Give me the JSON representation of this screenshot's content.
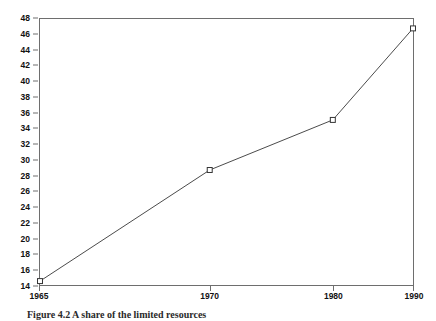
{
  "chart_data": {
    "type": "line",
    "title": "",
    "xlabel": "",
    "ylabel": "",
    "categories": [
      "1965",
      "1970",
      "1980",
      "1990"
    ],
    "x": [
      1965,
      1970,
      1980,
      1990
    ],
    "values": [
      14.5,
      28.7,
      35.1,
      46.8
    ],
    "series": [
      {
        "name": "",
        "values": [
          14.5,
          28.7,
          35.1,
          46.8
        ]
      }
    ],
    "ylim": [
      14,
      48
    ],
    "ytick_step": 2,
    "yticks": [
      14,
      16,
      18,
      20,
      22,
      24,
      26,
      28,
      30,
      32,
      34,
      36,
      38,
      40,
      42,
      44,
      46,
      48
    ],
    "ytick_labels": [
      "14",
      "16",
      "18",
      "20",
      "22",
      "24",
      "26",
      "28",
      "30",
      "32",
      "34",
      "36",
      "38",
      "40",
      "42",
      "44",
      "46",
      "48"
    ],
    "xticks": [
      1965,
      1970,
      1980,
      1990
    ],
    "xtick_labels": [
      "1965",
      "1970",
      "1980",
      "1990"
    ],
    "xtick_positions_pct": [
      0,
      45.5,
      78.5,
      100
    ],
    "grid": false,
    "legend": null,
    "marker": "open-square",
    "line_color": "#4a4a4a",
    "marker_color": "#333333",
    "frame_color": "#6e6e6e",
    "background": "#ffffff"
  },
  "caption": {
    "text": "Figure 4.2  A share of the limited resources"
  }
}
